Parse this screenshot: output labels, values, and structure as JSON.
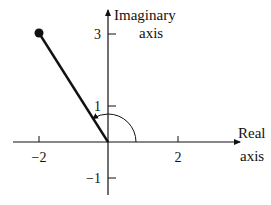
{
  "diagram": {
    "type": "complex-plane",
    "axes": {
      "x_label_line1": "Real",
      "x_label_line2": "axis",
      "y_label_line1": "Imaginary",
      "y_label_line2": "axis"
    },
    "ticks": {
      "x": [
        {
          "value": -2,
          "label": "−2"
        },
        {
          "value": 2,
          "label": "2"
        }
      ],
      "y": [
        {
          "value": 3,
          "label": "3"
        },
        {
          "value": 1,
          "label": "1"
        },
        {
          "value": -1,
          "label": "−1"
        }
      ]
    },
    "point": {
      "re": -2,
      "im": 3
    },
    "angle_arc": {
      "from": "positive real axis",
      "to": "vector",
      "direction": "counterclockwise"
    },
    "colors": {
      "ink": "#111111",
      "background": "#ffffff"
    }
  }
}
